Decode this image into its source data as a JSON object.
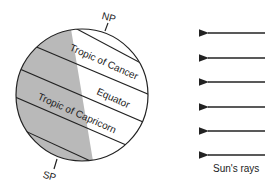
{
  "diagram": {
    "labels": {
      "north_pole": "NP",
      "south_pole": "SP",
      "tropic_cancer": "Tropic of Cancer",
      "equator": "Equator",
      "tropic_capricorn": "Tropic of Capricorn",
      "sun_rays": "Sun's rays"
    },
    "colors": {
      "night_side": "#b9b9b9",
      "day_side": "#ffffff",
      "stroke": "#222222"
    },
    "ray_count": 6
  }
}
